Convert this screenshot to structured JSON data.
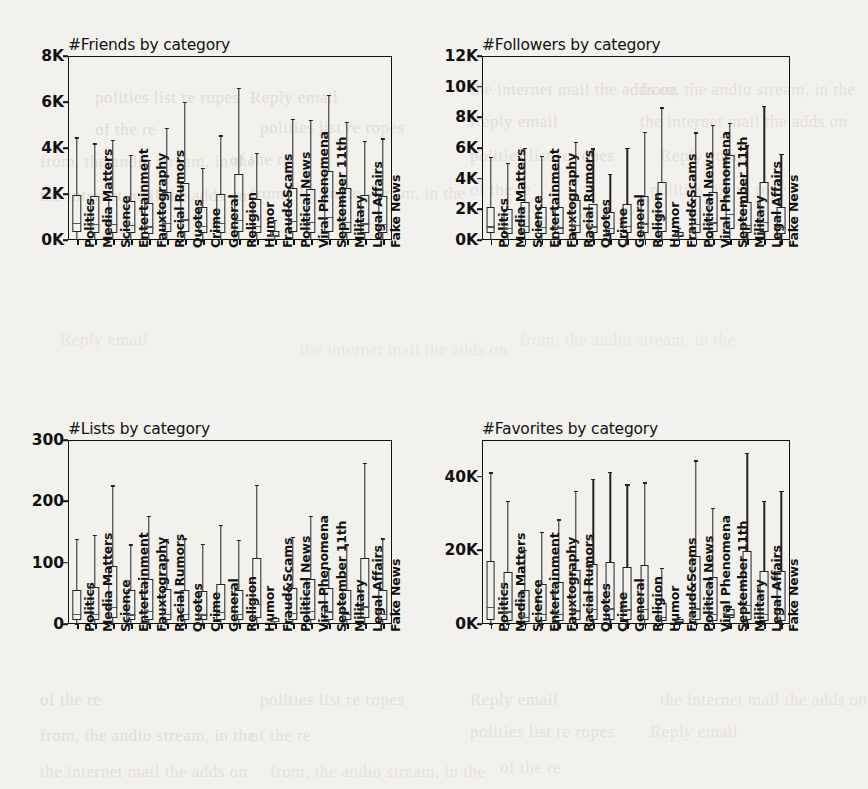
{
  "page": {
    "background_color": "#f3f1ee",
    "ink_color": "#111111",
    "bleed_through_lines": [
      "polities list re ropes",
      "Reply email",
      "the internet mail the adds on",
      "from, the andio stream, in the",
      "of the re"
    ]
  },
  "categories": [
    "Politics",
    "Media Matters",
    "Science",
    "Entertainment",
    "Fauxtography",
    "Racial Rumors",
    "Quotes",
    "Crime",
    "General",
    "Religion",
    "Humor",
    "Fraud&Scams",
    "Political News",
    "Viral Phenomena",
    "September 11th",
    "Military",
    "Legal Affairs",
    "Fake News"
  ],
  "chart_data": [
    {
      "type": "box",
      "id": "friends",
      "title": "#Friends by category",
      "xlabel": "",
      "ylabel": "",
      "ylim": [
        0,
        8000
      ],
      "yticks": [
        0,
        2000,
        4000,
        6000,
        8000
      ],
      "ytick_labels": [
        "0K",
        "2K",
        "4K",
        "6K",
        "8K"
      ],
      "grid": false,
      "categories": [
        "Politics",
        "Media Matters",
        "Science",
        "Entertainment",
        "Fauxtography",
        "Racial Rumors",
        "Quotes",
        "Crime",
        "General",
        "Religion",
        "Humor",
        "Fraud&Scams",
        "Political News",
        "Viral Phenomena",
        "September 11th",
        "Military",
        "Legal Affairs",
        "Fake News"
      ],
      "boxes": [
        {
          "category": "Politics",
          "whislo": 60,
          "q1": 330,
          "med": 760,
          "q3": 1960,
          "whishi": 4470
        },
        {
          "category": "Media Matters",
          "whislo": 60,
          "q1": 300,
          "med": 700,
          "q3": 1900,
          "whishi": 4200
        },
        {
          "category": "Science",
          "whislo": 60,
          "q1": 310,
          "med": 700,
          "q3": 1930,
          "whishi": 4350
        },
        {
          "category": "Entertainment",
          "whislo": 60,
          "q1": 300,
          "med": 660,
          "q3": 1700,
          "whishi": 3700
        },
        {
          "category": "Fauxtography",
          "whislo": 60,
          "q1": 280,
          "med": 600,
          "q3": 1620,
          "whishi": 3480
        },
        {
          "category": "Racial Rumors",
          "whislo": 60,
          "q1": 330,
          "med": 760,
          "q3": 2070,
          "whishi": 4890
        },
        {
          "category": "Quotes",
          "whislo": 60,
          "q1": 350,
          "med": 900,
          "q3": 2500,
          "whishi": 6020
        },
        {
          "category": "Crime",
          "whislo": 60,
          "q1": 300,
          "med": 620,
          "q3": 1420,
          "whishi": 3130
        },
        {
          "category": "General",
          "whislo": 60,
          "q1": 320,
          "med": 740,
          "q3": 2020,
          "whishi": 4560
        },
        {
          "category": "Religion",
          "whislo": 60,
          "q1": 350,
          "med": 880,
          "q3": 2880,
          "whishi": 6620
        },
        {
          "category": "Humor",
          "whislo": 60,
          "q1": 290,
          "med": 620,
          "q3": 1800,
          "whishi": 3780
        },
        {
          "category": "Fraud&Scams",
          "whislo": 60,
          "q1": 120,
          "med": 210,
          "q3": 390,
          "whishi": 880
        },
        {
          "category": "Political News",
          "whislo": 60,
          "q1": 330,
          "med": 830,
          "q3": 2250,
          "whishi": 5280
        },
        {
          "category": "Viral Phenomena",
          "whislo": 60,
          "q1": 320,
          "med": 800,
          "q3": 2230,
          "whishi": 5230
        },
        {
          "category": "September 11th",
          "whislo": 60,
          "q1": 360,
          "med": 1000,
          "q3": 3000,
          "whishi": 6320
        },
        {
          "category": "Military",
          "whislo": 60,
          "q1": 320,
          "med": 780,
          "q3": 2250,
          "whishi": 5130
        },
        {
          "category": "Legal Affairs",
          "whislo": 60,
          "q1": 310,
          "med": 720,
          "q3": 1950,
          "whishi": 4300
        },
        {
          "category": "Fake News",
          "whislo": 60,
          "q1": 300,
          "med": 700,
          "q3": 1930,
          "whishi": 4430
        }
      ]
    },
    {
      "type": "box",
      "id": "followers",
      "title": "#Followers by category",
      "xlabel": "",
      "ylabel": "",
      "ylim": [
        0,
        12000
      ],
      "yticks": [
        0,
        2000,
        4000,
        6000,
        8000,
        10000,
        12000
      ],
      "ytick_labels": [
        "0K",
        "2K",
        "4K",
        "6K",
        "8K",
        "10K",
        "12K"
      ],
      "grid": false,
      "categories": [
        "Politics",
        "Media Matters",
        "Science",
        "Entertainment",
        "Fauxtography",
        "Racial Rumors",
        "Quotes",
        "Crime",
        "General",
        "Religion",
        "Humor",
        "Fraud&Scams",
        "Political News",
        "Viral Phenomena",
        "September 11th",
        "Military",
        "Legal Affairs",
        "Fake News"
      ],
      "boxes": [
        {
          "category": "Politics",
          "whislo": 80,
          "q1": 430,
          "med": 900,
          "q3": 2180,
          "whishi": 5420
        },
        {
          "category": "Media Matters",
          "whislo": 80,
          "q1": 400,
          "med": 800,
          "q3": 2000,
          "whishi": 5050
        },
        {
          "category": "Science",
          "whislo": 80,
          "q1": 450,
          "med": 940,
          "q3": 2450,
          "whishi": 6000
        },
        {
          "category": "Entertainment",
          "whislo": 80,
          "q1": 420,
          "med": 880,
          "q3": 2150,
          "whishi": 5480
        },
        {
          "category": "Fauxtography",
          "whislo": 80,
          "q1": 410,
          "med": 840,
          "q3": 2130,
          "whishi": 5460
        },
        {
          "category": "Racial Rumors",
          "whislo": 80,
          "q1": 450,
          "med": 980,
          "q3": 2600,
          "whishi": 6400
        },
        {
          "category": "Quotes",
          "whislo": 80,
          "q1": 430,
          "med": 900,
          "q3": 2380,
          "whishi": 5980
        },
        {
          "category": "Crime",
          "whislo": 80,
          "q1": 400,
          "med": 780,
          "q3": 1820,
          "whishi": 4310
        },
        {
          "category": "General",
          "whislo": 80,
          "q1": 430,
          "med": 920,
          "q3": 2380,
          "whishi": 6000
        },
        {
          "category": "Religion",
          "whislo": 80,
          "q1": 470,
          "med": 1080,
          "q3": 2900,
          "whishi": 7050
        },
        {
          "category": "Humor",
          "whislo": 80,
          "q1": 550,
          "med": 1500,
          "q3": 3800,
          "whishi": 8650
        },
        {
          "category": "Fraud&Scams",
          "whislo": 80,
          "q1": 180,
          "med": 330,
          "q3": 530,
          "whishi": 800
        },
        {
          "category": "Political News",
          "whislo": 80,
          "q1": 470,
          "med": 1050,
          "q3": 2850,
          "whishi": 7020
        },
        {
          "category": "Viral Phenomena",
          "whislo": 80,
          "q1": 500,
          "med": 1150,
          "q3": 3150,
          "whishi": 7500
        },
        {
          "category": "September 11th",
          "whislo": 80,
          "q1": 700,
          "med": 1700,
          "q3": 5520,
          "whishi": 7650
        },
        {
          "category": "Military",
          "whislo": 80,
          "q1": 450,
          "med": 980,
          "q3": 2500,
          "whishi": 6180
        },
        {
          "category": "Legal Affairs",
          "whislo": 80,
          "q1": 520,
          "med": 1200,
          "q3": 3780,
          "whishi": 8750
        },
        {
          "category": "Fake News",
          "whislo": 80,
          "q1": 420,
          "med": 880,
          "q3": 2180,
          "whishi": 5620
        }
      ]
    },
    {
      "type": "box",
      "id": "lists",
      "title": "#Lists by category",
      "xlabel": "",
      "ylabel": "",
      "ylim": [
        0,
        300
      ],
      "yticks": [
        0,
        100,
        200,
        300
      ],
      "ytick_labels": [
        "0",
        "100",
        "200",
        "300"
      ],
      "grid": false,
      "categories": [
        "Politics",
        "Media Matters",
        "Science",
        "Entertainment",
        "Fauxtography",
        "Racial Rumors",
        "Quotes",
        "Crime",
        "General",
        "Religion",
        "Humor",
        "Fraud&Scams",
        "Political News",
        "Viral Phenomena",
        "September 11th",
        "Military",
        "Legal Affairs",
        "Fake News"
      ],
      "boxes": [
        {
          "category": "Politics",
          "whislo": 1,
          "q1": 6,
          "med": 17,
          "q3": 56,
          "whishi": 139
        },
        {
          "category": "Media Matters",
          "whislo": 1,
          "q1": 6,
          "med": 17,
          "q3": 60,
          "whishi": 145
        },
        {
          "category": "Science",
          "whislo": 1,
          "q1": 9,
          "med": 28,
          "q3": 94,
          "whishi": 226
        },
        {
          "category": "Entertainment",
          "whislo": 1,
          "q1": 6,
          "med": 16,
          "q3": 55,
          "whishi": 130
        },
        {
          "category": "Fauxtography",
          "whislo": 1,
          "q1": 7,
          "med": 22,
          "q3": 73,
          "whishi": 176
        },
        {
          "category": "Racial Rumors",
          "whislo": 1,
          "q1": 6,
          "med": 17,
          "q3": 57,
          "whishi": 139
        },
        {
          "category": "Quotes",
          "whislo": 1,
          "q1": 6,
          "med": 17,
          "q3": 56,
          "whishi": 140
        },
        {
          "category": "Crime",
          "whislo": 1,
          "q1": 6,
          "med": 16,
          "q3": 54,
          "whishi": 131
        },
        {
          "category": "General",
          "whislo": 1,
          "q1": 7,
          "med": 20,
          "q3": 66,
          "whishi": 162
        },
        {
          "category": "Religion",
          "whislo": 1,
          "q1": 6,
          "med": 17,
          "q3": 56,
          "whishi": 137
        },
        {
          "category": "Humor",
          "whislo": 1,
          "q1": 10,
          "med": 33,
          "q3": 107,
          "whishi": 227
        },
        {
          "category": "Fraud&Scams",
          "whislo": 1,
          "q1": 3,
          "med": 5,
          "q3": 9,
          "whishi": 12
        },
        {
          "category": "Political News",
          "whislo": 1,
          "q1": 6,
          "med": 18,
          "q3": 58,
          "whishi": 142
        },
        {
          "category": "Viral Phenomena",
          "whislo": 1,
          "q1": 7,
          "med": 22,
          "q3": 73,
          "whishi": 176
        },
        {
          "category": "September 11th",
          "whislo": 1,
          "q1": 7,
          "med": 21,
          "q3": 58,
          "whishi": 91
        },
        {
          "category": "Military",
          "whislo": 1,
          "q1": 6,
          "med": 17,
          "q3": 55,
          "whishi": 130
        },
        {
          "category": "Legal Affairs",
          "whislo": 1,
          "q1": 9,
          "med": 29,
          "q3": 108,
          "whishi": 263
        },
        {
          "category": "Fake News",
          "whislo": 1,
          "q1": 6,
          "med": 17,
          "q3": 56,
          "whishi": 140
        }
      ]
    },
    {
      "type": "box",
      "id": "favorites",
      "title": "#Favorites by category",
      "xlabel": "",
      "ylabel": "",
      "ylim": [
        0,
        50000
      ],
      "yticks": [
        0,
        20000,
        40000
      ],
      "ytick_labels": [
        "0K",
        "20K",
        "40K"
      ],
      "grid": false,
      "categories": [
        "Politics",
        "Media Matters",
        "Science",
        "Entertainment",
        "Fauxtography",
        "Racial Rumors",
        "Quotes",
        "Crime",
        "General",
        "Religion",
        "Humor",
        "Fraud&Scams",
        "Political News",
        "Viral Phenomena",
        "September 11th",
        "Military",
        "Legal Affairs",
        "Fake News"
      ],
      "boxes": [
        {
          "category": "Politics",
          "whislo": 200,
          "q1": 1100,
          "med": 4600,
          "q3": 17200,
          "whishi": 41200
        },
        {
          "category": "Media Matters",
          "whislo": 200,
          "q1": 900,
          "med": 3500,
          "q3": 14000,
          "whishi": 33500
        },
        {
          "category": "Science",
          "whislo": 200,
          "q1": 600,
          "med": 2000,
          "q3": 9200,
          "whishi": 20200
        },
        {
          "category": "Entertainment",
          "whislo": 200,
          "q1": 800,
          "med": 2700,
          "q3": 11000,
          "whishi": 25000
        },
        {
          "category": "Fauxtography",
          "whislo": 200,
          "q1": 800,
          "med": 2700,
          "q3": 11500,
          "whishi": 28500
        },
        {
          "category": "Racial Rumors",
          "whislo": 200,
          "q1": 1000,
          "med": 3700,
          "q3": 14800,
          "whishi": 36200
        },
        {
          "category": "Quotes",
          "whislo": 200,
          "q1": 1000,
          "med": 4200,
          "q3": 16200,
          "whishi": 39500
        },
        {
          "category": "Crime",
          "whislo": 200,
          "q1": 1000,
          "med": 4300,
          "q3": 16800,
          "whishi": 41300
        },
        {
          "category": "General",
          "whislo": 200,
          "q1": 1000,
          "med": 4000,
          "q3": 15500,
          "whishi": 38000
        },
        {
          "category": "Religion",
          "whislo": 200,
          "q1": 1000,
          "med": 4200,
          "q3": 16000,
          "whishi": 38500
        },
        {
          "category": "Humor",
          "whislo": 200,
          "q1": 700,
          "med": 2000,
          "q3": 5700,
          "whishi": 15300
        },
        {
          "category": "Fraud&Scams",
          "whislo": 200,
          "q1": 400,
          "med": 800,
          "q3": 1400,
          "whishi": 1900
        },
        {
          "category": "Political News",
          "whislo": 200,
          "q1": 1000,
          "med": 4300,
          "q3": 18500,
          "whishi": 44500
        },
        {
          "category": "Viral Phenomena",
          "whislo": 200,
          "q1": 800,
          "med": 2700,
          "q3": 12800,
          "whishi": 31500
        },
        {
          "category": "September 11th",
          "whislo": 200,
          "q1": 1500,
          "med": 2600,
          "q3": 4200,
          "whishi": 4800
        },
        {
          "category": "Military",
          "whislo": 200,
          "q1": 1200,
          "med": 5200,
          "q3": 19800,
          "whishi": 46500
        },
        {
          "category": "Legal Affairs",
          "whislo": 200,
          "q1": 800,
          "med": 2800,
          "q3": 14300,
          "whishi": 33500
        },
        {
          "category": "Fake News",
          "whislo": 200,
          "q1": 800,
          "med": 2800,
          "q3": 14500,
          "whishi": 36200
        }
      ]
    }
  ]
}
